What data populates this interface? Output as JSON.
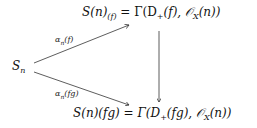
{
  "diagram": {
    "type": "commutative-diagram",
    "nodes": {
      "source": {
        "text": "S",
        "sub": "n"
      },
      "top": {
        "left": "S(n)",
        "sub": "(f)",
        "right": " = Γ(D",
        "sub2": "+",
        "right2": "(f), 𝒪",
        "sub3": "X",
        "right3": "(n))"
      },
      "bottom": {
        "left": "S(n)(fg) = Γ(D",
        "sub": "+",
        "right": "(fg), 𝒪",
        "sub2": "X",
        "right2": "(n))"
      }
    },
    "edges": {
      "top_label": {
        "text": "α",
        "sub": "n",
        "rest": "(f)"
      },
      "bottom_label": {
        "text": "α",
        "sub": "n",
        "rest": "(fg)"
      },
      "vertical": ""
    },
    "colors": {
      "stroke": "#333333",
      "text": "#111111"
    }
  }
}
